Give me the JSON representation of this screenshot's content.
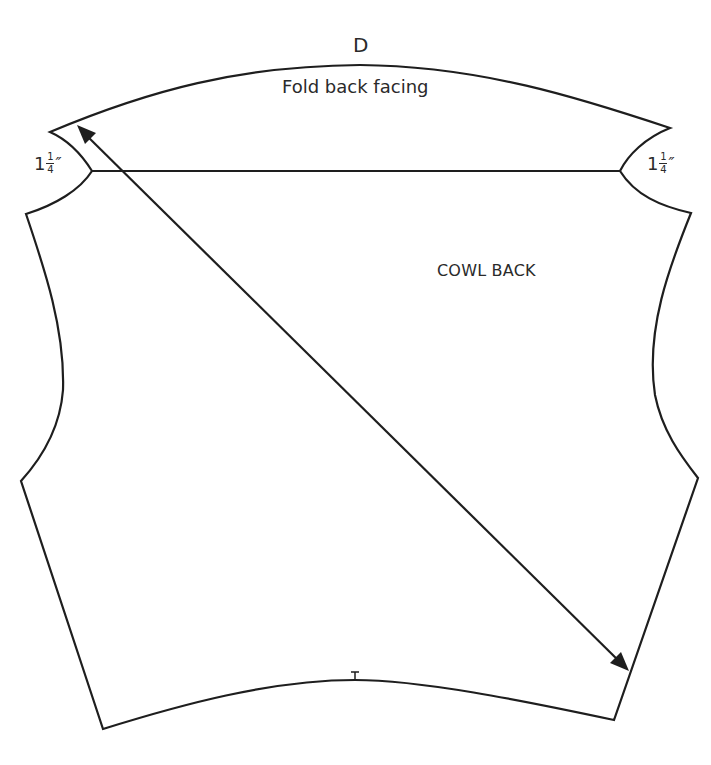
{
  "diagram": {
    "type": "sewing-pattern-piece",
    "piece_letter": "D",
    "piece_name": "COWL BACK",
    "facing_label": "Fold back facing",
    "measurements": {
      "left": {
        "whole": "1",
        "numerator": "1",
        "denominator": "4",
        "unit": "″"
      },
      "right": {
        "whole": "1",
        "numerator": "1",
        "denominator": "4",
        "unit": "″"
      }
    },
    "markings": {
      "grainline": "diagonal double-headed arrow (bias grain)",
      "notch": "center-back notch at hem"
    },
    "colors": {
      "line": "#1e1e1e",
      "text": "#2a2a2a",
      "background": "#ffffff"
    }
  }
}
